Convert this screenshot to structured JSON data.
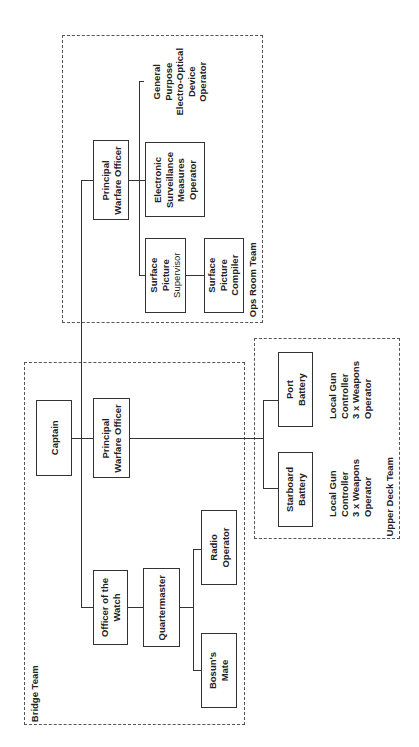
{
  "teams": {
    "ops_room": {
      "label": "Ops Room Team"
    },
    "bridge": {
      "label": "Bridge Team"
    },
    "upper_deck": {
      "label": "Upper Deck Team"
    }
  },
  "nodes": {
    "captain": {
      "lines": [
        "Captain"
      ]
    },
    "bridge_pwo": {
      "lines": [
        "Principal",
        "Warfare Officer"
      ]
    },
    "oow": {
      "lines": [
        "Officer of the",
        "Watch"
      ]
    },
    "quartermaster": {
      "lines": [
        "Quartermaster"
      ]
    },
    "radio_operator": {
      "lines": [
        "Radio",
        "Operator"
      ]
    },
    "bosuns_mate": {
      "lines": [
        "Bosun's",
        "Mate"
      ]
    },
    "ops_pwo": {
      "lines": [
        "Principal",
        "Warfare Officer"
      ]
    },
    "esm_operator": {
      "lines": [
        "Electronic",
        "Surveillance",
        "Measures",
        "Operator"
      ]
    },
    "gpeod_operator": {
      "lines": [
        "General",
        "Purpose",
        "Electro-Optical",
        "Device",
        "Operator"
      ]
    },
    "sps": {
      "lines": [
        "Surface",
        "Picture",
        "Supervisor"
      ]
    },
    "spc": {
      "lines": [
        "Surface",
        "Picture",
        "Compiler"
      ]
    },
    "port_battery": {
      "lines": [
        "Port",
        "Battery"
      ]
    },
    "starboard_battery": {
      "lines": [
        "Starboard",
        "Battery"
      ]
    },
    "port_crew": {
      "lines": [
        "Local Gun",
        "Controller",
        "3 x Weapons",
        "Operator"
      ]
    },
    "starboard_crew": {
      "lines": [
        "Local Gun",
        "Controller",
        "3 x Weapons",
        "Operator"
      ]
    }
  }
}
